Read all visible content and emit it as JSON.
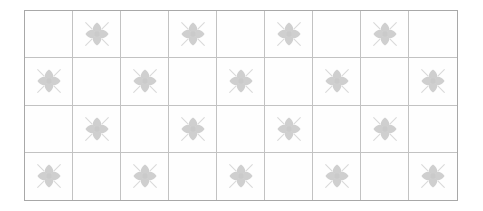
{
  "document": {
    "title": "Decorative tile pattern",
    "background_color": "#ffffff"
  },
  "grid": {
    "columns": 9,
    "rows": 4,
    "outer_border_color": "#a8a8a8",
    "inner_line_color": "#c2c2c2",
    "tile_fill_color": "#fefefe",
    "left": 24,
    "top": 10,
    "width": 434,
    "height": 191,
    "cell_width": 48.2,
    "cell_height": 47.8
  },
  "motif": {
    "name": "flower-motif",
    "petal_count": 4,
    "ray_count": 4,
    "petal_color": "#cfcfcf",
    "ray_color": "#d9d9d9",
    "center_color": "#cacaca",
    "size": 34
  },
  "layout": {
    "pattern": "checkerboard",
    "cells": [
      [
        false,
        true,
        false,
        true,
        false,
        true,
        false,
        true,
        false
      ],
      [
        true,
        false,
        true,
        false,
        true,
        false,
        true,
        false,
        true
      ],
      [
        false,
        true,
        false,
        true,
        false,
        true,
        false,
        true,
        false
      ],
      [
        true,
        false,
        true,
        false,
        true,
        false,
        true,
        false,
        true
      ]
    ]
  }
}
